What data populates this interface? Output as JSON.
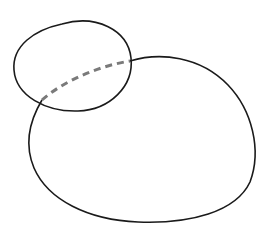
{
  "diagram": {
    "shapes": [
      {
        "id": "small-ellipse",
        "role": "front shape"
      },
      {
        "id": "large-blob",
        "role": "back shape"
      }
    ],
    "hidden_edge": {
      "style": "dashed"
    },
    "colors": {
      "outline": "#1a1a1a",
      "hidden_edge": "#7a7a7a",
      "background": "#ffffff"
    }
  }
}
